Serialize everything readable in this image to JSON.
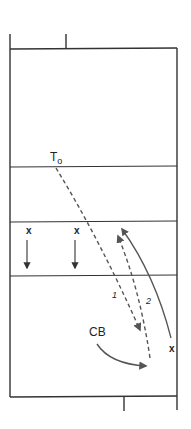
{
  "diagram": {
    "type": "court-play-diagram",
    "colors": {
      "line": "#333333",
      "arrow": "#555555",
      "background": "#ffffff"
    },
    "labels": {
      "to": "T",
      "to_sub": "o",
      "cb": "CB",
      "player_x1": "x",
      "player_x2": "x",
      "player_x3": "x",
      "path1": "1",
      "path2": "2"
    }
  }
}
